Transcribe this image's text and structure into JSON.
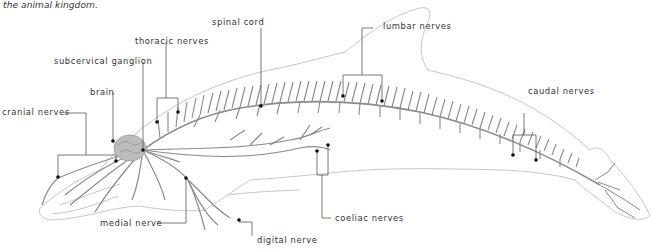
{
  "caption": "the animal kingdom.",
  "diagram": {
    "labels": {
      "spinal_cord": "spinal cord",
      "lumbar_nerves": "lumbar nerves",
      "thoracic_nerves": "thoracic nerves",
      "subcervical_ganglion": "subcervical ganglion",
      "brain": "brain",
      "cranial_nerves": "cranial nerves",
      "caudal_nerves": "caudal nerves",
      "medial_nerve": "medial nerve",
      "coeliac_nerves": "coeliac nerves",
      "digital_nerve": "digital nerve"
    },
    "colors": {
      "outline": "#c8c8c8",
      "nerve": "#8a8a8a",
      "leader": "#555555",
      "brain": "#bdbdbd"
    }
  }
}
